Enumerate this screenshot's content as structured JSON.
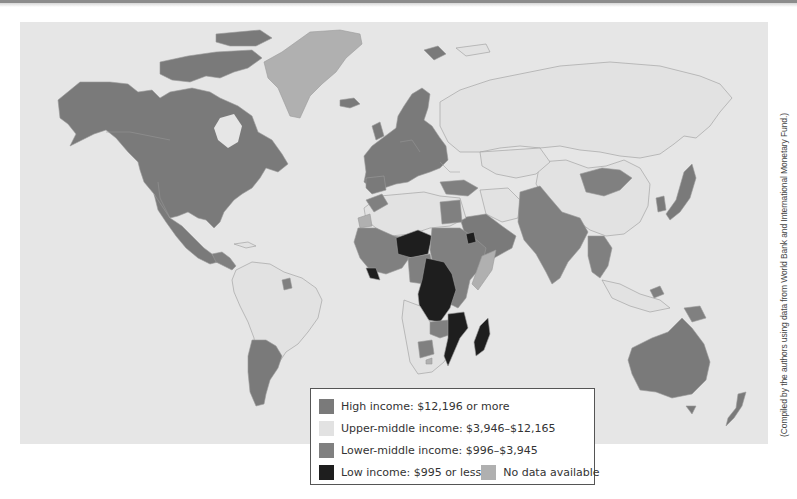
{
  "figure": {
    "type": "choropleth world map",
    "theme": "Gross national income per capita by country income group",
    "colors": {
      "ocean": "#e6e6e6",
      "high_income": "#7a7a7a",
      "upper_middle_income": "#e2e2e2",
      "lower_middle_income": "#808080",
      "low_income": "#1e1e1e",
      "no_data": "#b0b0b0",
      "border": "#9a9a9a"
    }
  },
  "legend": {
    "items": [
      {
        "key": "high",
        "label": "High income: $12,196 or more",
        "color": "#7a7a7a"
      },
      {
        "key": "upper_middle",
        "label": "Upper-middle income: $3,946–$12,165",
        "color": "#e2e2e2"
      },
      {
        "key": "lower_middle",
        "label": "Lower-middle income: $996–$3,945",
        "color": "#808080"
      },
      {
        "key": "low",
        "label": "Low income: $995 or less",
        "color": "#1e1e1e"
      },
      {
        "key": "no_data",
        "label": "No data available",
        "color": "#b0b0b0"
      }
    ]
  },
  "source_note": "(Compiled by the authors using data from World Bank and International Monetary Fund.)",
  "regions": {
    "high_income_examples": [
      "Canada",
      "United States",
      "Western Europe",
      "Scandinavia",
      "Japan",
      "South Korea",
      "Australia",
      "New Zealand",
      "Saudi Arabia",
      "Chile",
      "Argentina",
      "Uruguay",
      "Iceland",
      "Svalbard"
    ],
    "upper_middle_income_examples": [
      "Russia",
      "China",
      "Brazil",
      "Mexico",
      "Kazakhstan",
      "Turkey",
      "Algeria",
      "Libya",
      "Iran",
      "South Africa",
      "Botswana",
      "Namibia",
      "Angola",
      "Colombia",
      "Peru",
      "Venezuela",
      "Thailand",
      "Malaysia"
    ],
    "lower_middle_income_examples": [
      "Mongolia",
      "India",
      "Pakistan",
      "Egypt",
      "Morocco",
      "Sudan",
      "Nigeria",
      "Kenya",
      "Ethiopia",
      "Vietnam",
      "Myanmar",
      "Papua New Guinea",
      "Ukraine",
      "Zambia",
      "Zimbabwe"
    ],
    "low_income_examples": [
      "Niger",
      "Democratic Republic of the Congo",
      "Central African Republic",
      "Mozambique",
      "Madagascar",
      "Malawi",
      "Liberia",
      "Sierra Leone",
      "Eritrea",
      "Burundi"
    ],
    "no_data_examples": [
      "Greenland",
      "Western Sahara",
      "Somalia",
      "Lesotho"
    ]
  }
}
